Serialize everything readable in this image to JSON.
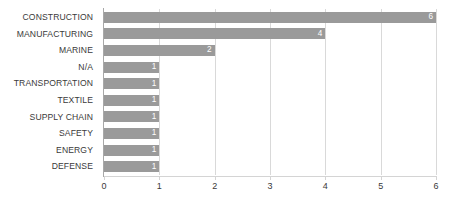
{
  "chart_data": {
    "type": "bar",
    "orientation": "horizontal",
    "title": "",
    "xlabel": "",
    "ylabel": "",
    "categories": [
      "CONSTRUCTION",
      "MANUFACTURING",
      "MARINE",
      "N/A",
      "TRANSPORTATION",
      "TEXTILE",
      "SUPPLY CHAIN",
      "SAFETY",
      "ENERGY",
      "DEFENSE"
    ],
    "values": [
      6,
      4,
      2,
      1,
      1,
      1,
      1,
      1,
      1,
      1
    ],
    "value_labels": [
      "6",
      "4",
      "2",
      "1",
      "1",
      "1",
      "1",
      "1",
      "1",
      "1"
    ],
    "xlim": [
      0,
      6
    ],
    "xticks": [
      0,
      1,
      2,
      3,
      4,
      5,
      6
    ],
    "xtick_labels": [
      "0",
      "1",
      "2",
      "3",
      "4",
      "5",
      "6"
    ],
    "grid": "vertical",
    "legend": "none",
    "data_labels_inside": true
  },
  "style": {
    "bar_color": "#9a9a9a",
    "value_label_color": "#ffffff",
    "category_label_color": "#3a3a3a",
    "tick_label_color": "#3a3a3a",
    "gridline_color": "#d9d9d9",
    "axis_color": "#a8a8a8",
    "background": "#ffffff"
  }
}
